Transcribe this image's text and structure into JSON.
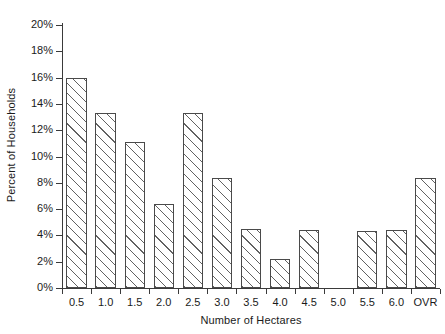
{
  "chart_data": {
    "type": "bar",
    "title": "",
    "subtitle": "",
    "xlabel": "Number of Hectares",
    "ylabel": "Percent of Households",
    "categories": [
      "0.5",
      "1.0",
      "1.5",
      "2.0",
      "2.5",
      "3.0",
      "3.5",
      "4.0",
      "4.5",
      "5.0",
      "5.5",
      "6.0",
      "OVR"
    ],
    "values": [
      16.0,
      13.3,
      11.1,
      6.4,
      13.3,
      8.4,
      4.5,
      2.2,
      4.4,
      0.0,
      4.3,
      4.4,
      8.4
    ],
    "ylim": [
      0,
      21
    ],
    "ytick_values": [
      0,
      2,
      4,
      6,
      8,
      10,
      12,
      14,
      16,
      18,
      20
    ],
    "ytick_labels": [
      "0%",
      "2%",
      "4%",
      "6%",
      "8%",
      "10%",
      "12%",
      "14%",
      "16%",
      "18%",
      "20%"
    ],
    "grid": false,
    "legend": null,
    "legend_position": "none",
    "bar_fill": "hatched-diagonal",
    "bar_edge_color": "#4a4a4a",
    "axis_color": "#3a3a3a",
    "background": "#ffffff"
  }
}
